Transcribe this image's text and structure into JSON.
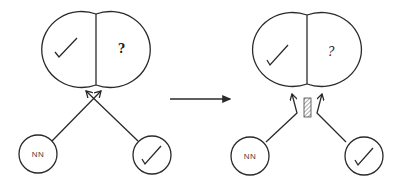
{
  "diagram": {
    "type": "before-after transition",
    "stroke_color": "#2a2a2a",
    "panels": [
      {
        "id": "before",
        "cell": {
          "left_half_symbol": "check-mark",
          "right_half_symbol": "?"
        },
        "inputs": [
          {
            "label": "NN",
            "position": "bottom-left"
          },
          {
            "symbol": "check-mark",
            "position": "bottom-right"
          }
        ],
        "arrows": "crossing arrows converge at cell junction",
        "block": null
      },
      {
        "id": "after",
        "cell": {
          "left_half_symbol": "check-mark",
          "right_half_symbol": "?"
        },
        "inputs": [
          {
            "label": "NN",
            "position": "bottom-left"
          },
          {
            "symbol": "check-mark",
            "position": "bottom-right"
          }
        ],
        "arrows": "bent arrows to each half, separated by hatched barrier",
        "block": "hatched-barrier"
      }
    ],
    "transition_arrow": "right-arrow"
  }
}
